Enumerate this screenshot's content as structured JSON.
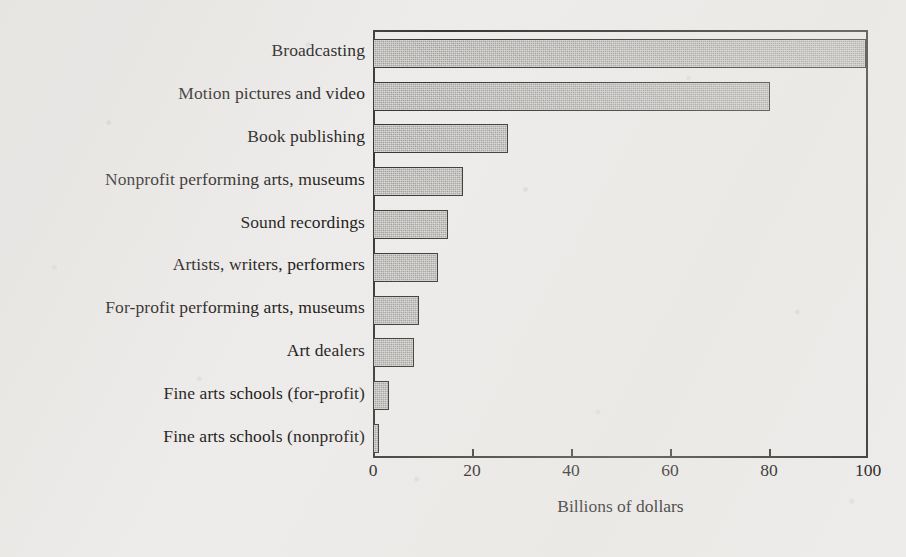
{
  "chart_data": {
    "type": "bar",
    "orientation": "horizontal",
    "title": "",
    "subtitle": "",
    "xlabel": "Billions of dollars",
    "ylabel": "",
    "xlim": [
      0,
      100
    ],
    "xticks": [
      0,
      20,
      40,
      60,
      80,
      100
    ],
    "xtick_labels": [
      "0",
      "20",
      "40",
      "60",
      "80",
      "100"
    ],
    "grid": false,
    "legend": null,
    "categories": [
      "Broadcasting",
      "Motion pictures and video",
      "Book publishing",
      "Nonprofit performing arts, museums",
      "Sound recordings",
      "Artists, writers, performers",
      "For-profit performing arts, museums",
      "Art dealers",
      "Fine arts schools (for-profit)",
      "Fine arts schools (nonprofit)"
    ],
    "values": [
      100,
      80,
      27,
      18,
      15,
      13,
      9,
      8,
      3,
      1
    ],
    "bar_fill_color": "#a9a7a4",
    "bar_edge_color": "#393734",
    "axis_color": "#3a3835",
    "background_color": "#edecea",
    "text_color": "#1d1b19"
  }
}
